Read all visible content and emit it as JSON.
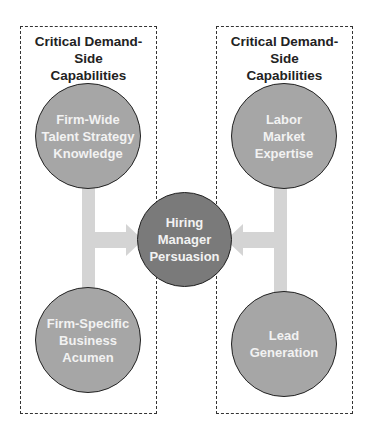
{
  "left_group": {
    "title": "Critical Demand-Side\nCapabilities",
    "top_node": "Firm-Wide\nTalent Strategy\nKnowledge",
    "bottom_node": "Firm-Specific\nBusiness\nAcumen"
  },
  "right_group": {
    "title": "Critical Demand-Side\nCapabilities",
    "top_node": "Labor\nMarket\nExpertise",
    "bottom_node": "Lead\nGeneration"
  },
  "center_node": "Hiring\nManager\nPersuasion",
  "colors": {
    "node_light": "#a6a6a6",
    "node_dark": "#7a7a7a",
    "connector": "#d4d4d4",
    "border": "#333333"
  }
}
